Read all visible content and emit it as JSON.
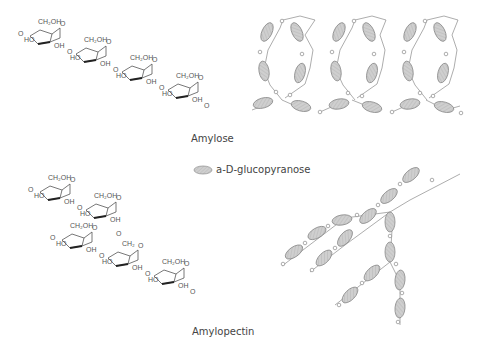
{
  "labels": {
    "amylose": "Amylose",
    "amylopectin": "Amylopectin",
    "legend": "a-D-glucopyranose"
  },
  "chem_text": {
    "ch2oh": "CH₂OH",
    "ho": "HO",
    "oh": "OH",
    "o": "O",
    "ch2": "CH₂"
  },
  "colors": {
    "ellipse_fill": "#c9c9c9",
    "ellipse_stroke": "#8a8a8a",
    "line": "#8a8a8a",
    "text": "#444444"
  },
  "legend_icon": "ellipse-glucose-unit-icon"
}
